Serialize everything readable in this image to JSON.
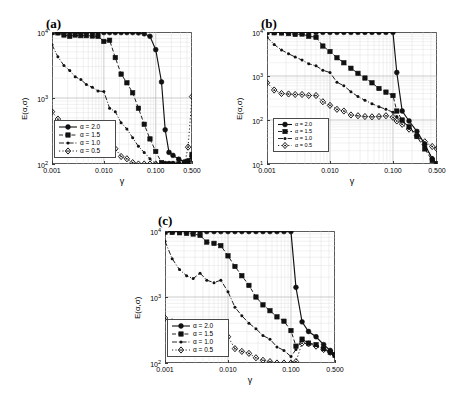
{
  "figure": {
    "panels": [
      {
        "id": "a",
        "label": "(a)",
        "ylabel": "E(α,σ)",
        "xlabel": "γ",
        "yticks": [
          "10",
          "10",
          "10"
        ],
        "ytick_exponents": [
          "4",
          "3",
          "2"
        ],
        "ytick_values": [
          10000,
          1000,
          100
        ],
        "ylim": [
          100,
          10000
        ],
        "xticks": [
          "0.001",
          "0.010",
          "0.100",
          "0.500"
        ],
        "xtick_values": [
          0.001,
          0.01,
          0.1,
          0.5
        ],
        "xlim": [
          0.001,
          0.5
        ]
      },
      {
        "id": "b",
        "label": "(b)",
        "ylabel": "E(α,σ)",
        "xlabel": "γ",
        "yticks": [
          "10",
          "10",
          "10",
          "10"
        ],
        "ytick_exponents": [
          "4",
          "3",
          "2",
          "1"
        ],
        "ytick_values": [
          10000,
          1000,
          100,
          10
        ],
        "ylim": [
          10,
          10000
        ],
        "xticks": [
          "0.001",
          "0.010",
          "0.100",
          "0.500"
        ],
        "xtick_values": [
          0.001,
          0.01,
          0.1,
          0.5
        ],
        "xlim": [
          0.001,
          0.5
        ]
      },
      {
        "id": "c",
        "label": "(c)",
        "ylabel": "E(α,σ)",
        "xlabel": "γ",
        "yticks": [
          "10",
          "10",
          "10"
        ],
        "ytick_exponents": [
          "4",
          "3",
          "2"
        ],
        "ytick_values": [
          10000,
          1000,
          100
        ],
        "ylim": [
          100,
          10000
        ],
        "xticks": [
          "0.001",
          "0.010",
          "0.100",
          "0.500"
        ],
        "xtick_values": [
          0.001,
          0.01,
          0.1,
          0.5
        ],
        "xlim": [
          0.001,
          0.5
        ]
      }
    ],
    "legend_entries": [
      {
        "label": "α = 2.0",
        "marker": "circle",
        "dash": "solid"
      },
      {
        "label": "α = 1.5",
        "marker": "square",
        "dash": "dashed"
      },
      {
        "label": "α = 1.0",
        "marker": "dot",
        "dash": "dashdot"
      },
      {
        "label": "α = 0.5",
        "marker": "diamond",
        "dash": "dotted"
      }
    ]
  },
  "chart_data": [
    {
      "type": "line",
      "panel": "a",
      "title": "(a)",
      "xlabel": "γ",
      "ylabel": "E(α,σ)",
      "xscale": "log",
      "yscale": "log",
      "xlim": [
        0.001,
        0.5
      ],
      "ylim": [
        100,
        10000
      ],
      "xticks": [
        0.001,
        0.01,
        0.1,
        0.5
      ],
      "yticks": [
        100,
        1000,
        10000
      ],
      "grid": true,
      "legend_position": "lower-left",
      "series": [
        {
          "name": "α = 2.0",
          "marker": "circle",
          "dash": "solid",
          "x": [
            0.001,
            0.0013,
            0.0017,
            0.0022,
            0.0028,
            0.0036,
            0.0046,
            0.006,
            0.0077,
            0.01,
            0.0129,
            0.0166,
            0.0215,
            0.0278,
            0.0359,
            0.0464,
            0.0599,
            0.0774,
            0.1,
            0.1292,
            0.152,
            0.18,
            0.215,
            0.278,
            0.359,
            0.42,
            0.5
          ],
          "y": [
            9800,
            9800,
            9800,
            9800,
            9800,
            9800,
            9800,
            9800,
            9800,
            9800,
            9800,
            9800,
            9800,
            9800,
            9800,
            9700,
            9400,
            8600,
            5400,
            1750,
            330,
            150,
            135,
            118,
            108,
            112,
            130
          ]
        },
        {
          "name": "α = 1.5",
          "marker": "square",
          "dash": "dashed",
          "x": [
            0.001,
            0.0013,
            0.0017,
            0.0022,
            0.0028,
            0.0036,
            0.0046,
            0.006,
            0.0077,
            0.01,
            0.0129,
            0.0166,
            0.0215,
            0.0278,
            0.0359,
            0.0464,
            0.0599,
            0.0774,
            0.1,
            0.1292,
            0.152,
            0.18,
            0.215,
            0.278,
            0.359,
            0.42,
            0.5
          ],
          "y": [
            9800,
            9700,
            9000,
            8600,
            9000,
            8800,
            8800,
            8700,
            8600,
            7200,
            7500,
            4100,
            2300,
            1700,
            1200,
            700,
            400,
            240,
            155,
            105,
            82,
            72,
            68,
            63,
            60,
            72,
            140
          ]
        },
        {
          "name": "α = 1.0",
          "marker": "dot",
          "dash": "dashdot",
          "x": [
            0.001,
            0.0013,
            0.0017,
            0.0022,
            0.0028,
            0.0036,
            0.0046,
            0.006,
            0.0077,
            0.01,
            0.0129,
            0.0166,
            0.0215,
            0.0278,
            0.0359,
            0.0464,
            0.0599,
            0.0774,
            0.1,
            0.1292,
            0.152,
            0.18,
            0.215,
            0.278,
            0.359,
            0.42,
            0.5
          ],
          "y": [
            6400,
            4200,
            3100,
            2600,
            2100,
            1900,
            1600,
            1450,
            1280,
            1250,
            700,
            620,
            420,
            340,
            250,
            185,
            150,
            120,
            92,
            80,
            78,
            75,
            70,
            62,
            58,
            62,
            115
          ]
        },
        {
          "name": "α = 0.5",
          "marker": "diamond",
          "dash": "dotted",
          "x": [
            0.001,
            0.0013,
            0.0017,
            0.0022,
            0.0028,
            0.0036,
            0.0046,
            0.006,
            0.0077,
            0.01,
            0.0129,
            0.0166,
            0.0215,
            0.0278,
            0.0359,
            0.0464,
            0.0599,
            0.0774,
            0.1,
            0.1292,
            0.152,
            0.18,
            0.215,
            0.278,
            0.359,
            0.42,
            0.5
          ],
          "y": [
            620,
            480,
            370,
            370,
            330,
            340,
            300,
            330,
            250,
            210,
            230,
            170,
            130,
            120,
            105,
            90,
            88,
            82,
            80,
            78,
            80,
            82,
            78,
            80,
            95,
            180,
            1050
          ]
        }
      ]
    },
    {
      "type": "line",
      "panel": "b",
      "title": "(b)",
      "xlabel": "γ",
      "ylabel": "E(α,σ)",
      "xscale": "log",
      "yscale": "log",
      "xlim": [
        0.001,
        0.5
      ],
      "ylim": [
        10,
        10000
      ],
      "xticks": [
        0.001,
        0.01,
        0.1,
        0.5
      ],
      "yticks": [
        10,
        100,
        1000,
        10000
      ],
      "grid": true,
      "legend_position": "lower-left",
      "series": [
        {
          "name": "α = 2.0",
          "marker": "circle",
          "dash": "solid",
          "x": [
            0.001,
            0.0013,
            0.0017,
            0.0022,
            0.0028,
            0.0036,
            0.0046,
            0.006,
            0.0077,
            0.01,
            0.0129,
            0.0166,
            0.0215,
            0.0278,
            0.0359,
            0.0464,
            0.0599,
            0.0774,
            0.1,
            0.115,
            0.14,
            0.18,
            0.24,
            0.32,
            0.42,
            0.5
          ],
          "y": [
            9800,
            9800,
            9800,
            9800,
            9800,
            9800,
            9800,
            9800,
            9800,
            9800,
            9800,
            9800,
            9800,
            9800,
            9800,
            9800,
            9800,
            9800,
            9800,
            1200,
            160,
            95,
            55,
            28,
            13,
            10
          ]
        },
        {
          "name": "α = 1.5",
          "marker": "square",
          "dash": "dashed",
          "x": [
            0.001,
            0.0013,
            0.0017,
            0.0022,
            0.0028,
            0.0036,
            0.0046,
            0.006,
            0.0077,
            0.01,
            0.0129,
            0.0166,
            0.0215,
            0.0278,
            0.0359,
            0.0464,
            0.0599,
            0.0774,
            0.1,
            0.115,
            0.14,
            0.18,
            0.24,
            0.32,
            0.42,
            0.5
          ],
          "y": [
            9800,
            9600,
            9500,
            9200,
            8800,
            9000,
            8000,
            7600,
            4800,
            3600,
            2600,
            2000,
            1500,
            1150,
            900,
            700,
            520,
            430,
            360,
            160,
            100,
            70,
            42,
            22,
            12,
            10
          ]
        },
        {
          "name": "α = 1.0",
          "marker": "dot",
          "dash": "dashdot",
          "x": [
            0.001,
            0.0013,
            0.0017,
            0.0022,
            0.0028,
            0.0036,
            0.0046,
            0.006,
            0.0077,
            0.01,
            0.0129,
            0.0166,
            0.0215,
            0.0278,
            0.0359,
            0.0464,
            0.0599,
            0.0774,
            0.1,
            0.115,
            0.14,
            0.18,
            0.24,
            0.32,
            0.42,
            0.5
          ],
          "y": [
            7600,
            5200,
            3900,
            3200,
            2700,
            2300,
            1900,
            1700,
            1350,
            1200,
            720,
            600,
            440,
            340,
            280,
            235,
            200,
            175,
            150,
            120,
            95,
            70,
            45,
            25,
            14,
            10
          ]
        },
        {
          "name": "α = 0.5",
          "marker": "diamond",
          "dash": "dotted",
          "x": [
            0.001,
            0.0013,
            0.0017,
            0.0022,
            0.0028,
            0.0036,
            0.0046,
            0.006,
            0.0077,
            0.01,
            0.0129,
            0.0166,
            0.0215,
            0.0278,
            0.0359,
            0.0464,
            0.0599,
            0.0774,
            0.1,
            0.115,
            0.14,
            0.18,
            0.24,
            0.32,
            0.42,
            0.5
          ],
          "y": [
            700,
            480,
            400,
            390,
            380,
            380,
            360,
            360,
            260,
            215,
            175,
            160,
            130,
            125,
            120,
            118,
            120,
            125,
            115,
            95,
            80,
            62,
            44,
            32,
            25,
            22
          ]
        }
      ]
    },
    {
      "type": "line",
      "panel": "c",
      "title": "(c)",
      "xlabel": "γ",
      "ylabel": "E(α,σ)",
      "xscale": "log",
      "yscale": "log",
      "xlim": [
        0.001,
        0.5
      ],
      "ylim": [
        100,
        10000
      ],
      "xticks": [
        0.001,
        0.01,
        0.1,
        0.5
      ],
      "yticks": [
        100,
        1000,
        10000
      ],
      "grid": true,
      "legend_position": "lower-left",
      "series": [
        {
          "name": "α = 2.0",
          "marker": "circle",
          "dash": "solid",
          "x": [
            0.001,
            0.0013,
            0.0017,
            0.0022,
            0.0028,
            0.0036,
            0.0046,
            0.006,
            0.0077,
            0.01,
            0.0129,
            0.0166,
            0.0215,
            0.0278,
            0.0359,
            0.0464,
            0.0599,
            0.0774,
            0.1,
            0.12,
            0.15,
            0.19,
            0.25,
            0.33,
            0.42,
            0.5
          ],
          "y": [
            9800,
            9800,
            9800,
            9800,
            9800,
            9800,
            9800,
            9800,
            9800,
            9800,
            9800,
            9800,
            9800,
            9800,
            9800,
            9800,
            9800,
            9800,
            9800,
            1400,
            420,
            300,
            250,
            190,
            155,
            135
          ]
        },
        {
          "name": "α = 1.5",
          "marker": "square",
          "dash": "dashed",
          "x": [
            0.001,
            0.0013,
            0.0017,
            0.0022,
            0.0028,
            0.0036,
            0.0046,
            0.006,
            0.0077,
            0.01,
            0.0129,
            0.0166,
            0.0215,
            0.0278,
            0.0359,
            0.0464,
            0.0599,
            0.0774,
            0.1,
            0.12,
            0.15,
            0.19,
            0.25,
            0.33,
            0.42,
            0.5
          ],
          "y": [
            9600,
            9500,
            9400,
            9200,
            9000,
            8600,
            6800,
            6500,
            6000,
            4200,
            2900,
            2100,
            1500,
            1000,
            760,
            620,
            500,
            430,
            310,
            180,
            230,
            200,
            190,
            165,
            145,
            130
          ]
        },
        {
          "name": "α = 1.0",
          "marker": "dot",
          "dash": "dashdot",
          "x": [
            0.001,
            0.0013,
            0.0017,
            0.0022,
            0.0028,
            0.0036,
            0.0046,
            0.006,
            0.0077,
            0.01,
            0.0129,
            0.0166,
            0.0215,
            0.0278,
            0.0359,
            0.0464,
            0.0599,
            0.0774,
            0.1,
            0.12,
            0.15,
            0.19,
            0.25,
            0.33,
            0.42,
            0.5
          ],
          "y": [
            7000,
            3800,
            2600,
            2100,
            1900,
            2300,
            1800,
            1650,
            1800,
            1200,
            700,
            520,
            400,
            330,
            260,
            230,
            175,
            155,
            125,
            160,
            220,
            200,
            185,
            160,
            145,
            130
          ]
        },
        {
          "name": "α = 0.5",
          "marker": "diamond",
          "dash": "dotted",
          "x": [
            0.001,
            0.0013,
            0.0017,
            0.0022,
            0.0028,
            0.0036,
            0.0046,
            0.006,
            0.0077,
            0.01,
            0.0129,
            0.0166,
            0.0215,
            0.0278,
            0.0359,
            0.0464,
            0.0599,
            0.0774,
            0.1,
            0.12,
            0.15,
            0.19,
            0.25,
            0.33,
            0.42,
            0.5
          ],
          "y": [
            480,
            420,
            360,
            330,
            300,
            290,
            270,
            270,
            260,
            250,
            165,
            150,
            140,
            120,
            110,
            105,
            100,
            95,
            92,
            105,
            200,
            195,
            180,
            160,
            145,
            132
          ]
        }
      ]
    }
  ]
}
